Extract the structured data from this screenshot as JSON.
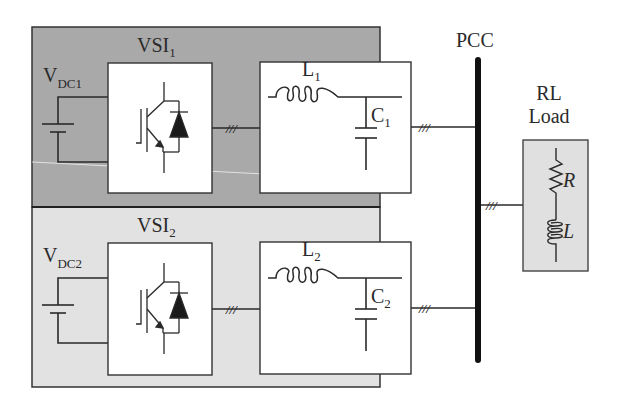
{
  "diagram": {
    "colors": {
      "vsi1_background": "#a9a9a9",
      "vsi2_background": "#e2e2e2",
      "load_background": "#e0e0e0",
      "box_fill": "#ffffff",
      "line": "#2a2a2a",
      "bus": "#111111"
    },
    "vsi1": {
      "title_main": "VSI",
      "title_sub": "1",
      "dc_source_main": "V",
      "dc_source_sub": "DC1",
      "inductor_main": "L",
      "inductor_sub": "1",
      "capacitor_main": "C",
      "capacitor_sub": "1",
      "three_phase_mark": "///"
    },
    "vsi2": {
      "title_main": "VSI",
      "title_sub": "2",
      "dc_source_main": "V",
      "dc_source_sub": "DC2",
      "inductor_main": "L",
      "inductor_sub": "2",
      "capacitor_main": "C",
      "capacitor_sub": "2",
      "three_phase_mark": "///"
    },
    "pcc": {
      "label": "PCC"
    },
    "load": {
      "title_line1": "RL",
      "title_line2": "Load",
      "resistor_label": "R",
      "inductor_label": "L",
      "three_phase_mark": "///"
    }
  }
}
